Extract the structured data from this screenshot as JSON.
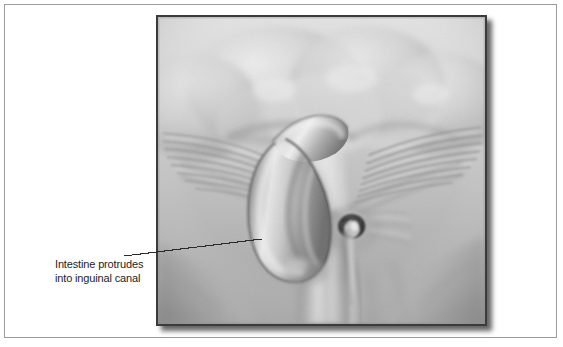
{
  "figure": {
    "type": "medical-illustration",
    "view": "anterior view of lower abdomen and groin",
    "rendering": "grayscale airbrush halftone illustration",
    "panel": {
      "background_top": "#dcdcdc",
      "background_bottom": "#a8a8a8",
      "border_color": "#3b3b3b",
      "shadow_color": "#4a4a4a"
    },
    "page_frame_color": "#9a9a9a",
    "page_background": "#ffffff"
  },
  "callout": {
    "text": "Intestine protrudes\ninto inguinal canal",
    "line1": "Intestine protrudes",
    "line2": "into inguinal canal",
    "text_color": "#1d1d1d",
    "leader_line_color": "#2b2b2b",
    "leader_line": {
      "from_x": 124,
      "from_y": 256,
      "to_x": 262,
      "to_y": 239
    }
  },
  "anatomy": {
    "structures": [
      {
        "name": "herniated-intestine-loop",
        "label": "Intestine protrudes into inguinal canal"
      },
      {
        "name": "inguinal-ring",
        "label": "Inguinal ring / external opening"
      },
      {
        "name": "spermatic-cord",
        "label": "Spermatic cord"
      },
      {
        "name": "external-oblique-aponeurosis-left",
        "label": "External oblique aponeurosis (left)"
      },
      {
        "name": "external-oblique-aponeurosis-right",
        "label": "External oblique aponeurosis (right)"
      },
      {
        "name": "lower-abdominal-wall",
        "label": "Lower abdominal wall"
      },
      {
        "name": "inguinal-ligament-left",
        "label": "Inguinal ligament (left)"
      },
      {
        "name": "inguinal-ligament-right",
        "label": "Inguinal ligament (right)"
      },
      {
        "name": "pubic-region",
        "label": "Pubic region / root of penis"
      },
      {
        "name": "medial-thigh-left",
        "label": "Medial thigh (left)"
      },
      {
        "name": "medial-thigh-right",
        "label": "Medial thigh (right)"
      }
    ]
  }
}
